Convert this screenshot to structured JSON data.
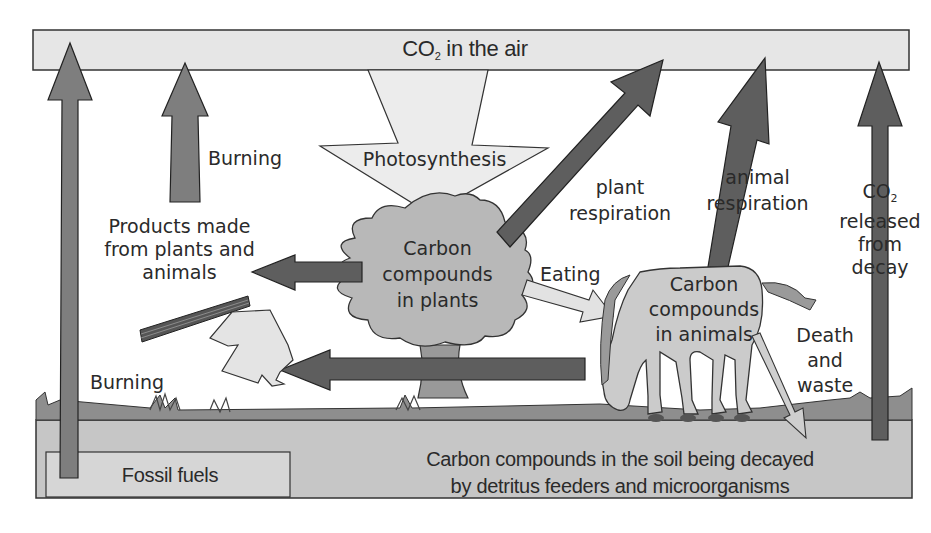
{
  "diagram": {
    "air": {
      "label_prefix": "CO",
      "label_sub": "2",
      "label_suffix": " in the air"
    },
    "photosynthesis": {
      "label": "Photosynthesis"
    },
    "plants": {
      "line1": "Carbon",
      "line2": "compounds",
      "line3": "in plants"
    },
    "animals": {
      "line1": "Carbon",
      "line2": "compounds",
      "line3": "in animals"
    },
    "burning_top": {
      "label": "Burning"
    },
    "burning_bottom": {
      "label": "Burning"
    },
    "products": {
      "line1": "Products made",
      "line2": "from plants and",
      "line3": "animals"
    },
    "plant_respiration": {
      "line1": "plant",
      "line2": "respiration"
    },
    "animal_respiration": {
      "line1": "animal",
      "line2": "respiration"
    },
    "eating": {
      "label": "Eating"
    },
    "decay_release": {
      "line1_prefix": "CO",
      "line1_sub": "2",
      "line2": "released",
      "line3": "from",
      "line4": "decay"
    },
    "death_waste": {
      "line1": "Death",
      "line2": "and",
      "line3": "waste"
    },
    "fossil_fuels": {
      "label": "Fossil fuels"
    },
    "soil": {
      "line1": "Carbon compounds in the soil being decayed",
      "line2": "by detritus feeders and microorganisms"
    },
    "colors": {
      "air_box": "#e6e6e6",
      "arrow_medium": "#7a7a7a",
      "arrow_dark": "#5c5c5c",
      "arrow_light": "#e8e8e8",
      "tree": "#b8b8b8",
      "horse": "#c9c9c9",
      "ground": "#8a8a8a",
      "soil": "#c4c4c4",
      "outline": "#333333"
    }
  }
}
